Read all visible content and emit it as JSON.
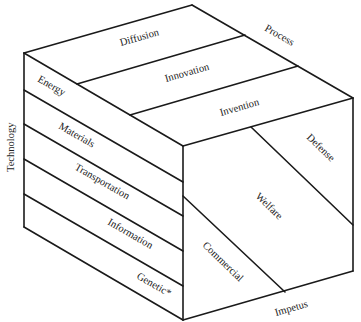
{
  "diagram": {
    "type": "three-dimensional cube taxonomy",
    "axes": {
      "process": "Process",
      "technology": "Technology",
      "impetus": "Impetus"
    },
    "top_face": {
      "axis": "Process",
      "segments": [
        "Diffusion",
        "Innovation",
        "Invention"
      ]
    },
    "left_face": {
      "axis": "Technology",
      "segments": [
        "Energy",
        "Materials",
        "Transportation",
        "Information",
        "Genetic*"
      ]
    },
    "right_face": {
      "axis": "Impetus",
      "segments": [
        "Defense",
        "Welfare",
        "Commercial"
      ]
    }
  }
}
